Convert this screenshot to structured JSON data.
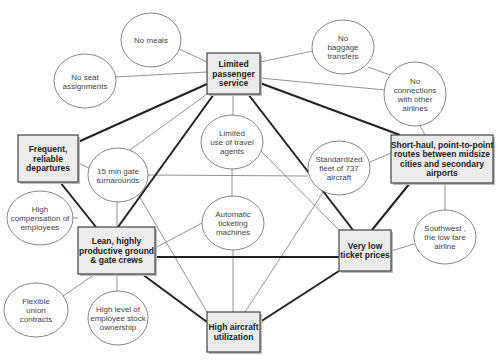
{
  "diagram": {
    "type": "activity-system-map",
    "boxes": [
      {
        "id": "limited_service",
        "lines": [
          "Limited",
          "passenger",
          "service"
        ],
        "x": 207,
        "y": 53,
        "w": 53,
        "h": 41
      },
      {
        "id": "frequent",
        "lines": [
          "Frequent,",
          "reliable",
          "departures"
        ],
        "x": 18,
        "y": 135,
        "w": 60,
        "h": 47
      },
      {
        "id": "short_haul",
        "lines": [
          "Short-haul, point-to-point",
          "routes between midsize",
          "cities and secondary",
          "airports"
        ],
        "x": 391,
        "y": 135,
        "w": 102,
        "h": 48
      },
      {
        "id": "lean_crews",
        "lines": [
          "Lean, highly",
          "productive ground",
          "& gate crews"
        ],
        "x": 78,
        "y": 227,
        "w": 77,
        "h": 47
      },
      {
        "id": "low_prices",
        "lines": [
          "Very low",
          "ticket prices"
        ],
        "x": 339,
        "y": 230,
        "w": 52,
        "h": 41
      },
      {
        "id": "high_util",
        "lines": [
          "High aircraft",
          "utilization"
        ],
        "x": 207,
        "y": 312,
        "w": 53,
        "h": 40
      }
    ],
    "ellipses": [
      {
        "id": "no_meals",
        "lines": [
          "No meals"
        ],
        "cx": 151,
        "cy": 40,
        "rx": 30,
        "ry": 27
      },
      {
        "id": "no_seat",
        "lines": [
          "No seat",
          "assignments"
        ],
        "cx": 85,
        "cy": 81,
        "rx": 31,
        "ry": 27
      },
      {
        "id": "no_baggage",
        "lines": [
          "No",
          "baggage",
          "transfers"
        ],
        "cx": 343,
        "cy": 47,
        "rx": 31,
        "ry": 27
      },
      {
        "id": "no_connections",
        "lines": [
          "No",
          "connections",
          "with other",
          "airlines"
        ],
        "cx": 415,
        "cy": 94,
        "rx": 31,
        "ry": 32
      },
      {
        "id": "travel_agents",
        "lines": [
          "Limited",
          "use of travel",
          "agents"
        ],
        "cx": 232,
        "cy": 142,
        "rx": 31,
        "ry": 27
      },
      {
        "id": "gate_turn",
        "lines": [
          "15 min gate",
          "turnarounds"
        ],
        "cx": 118,
        "cy": 175,
        "rx": 30,
        "ry": 27
      },
      {
        "id": "fleet",
        "lines": [
          "Standardized",
          "fleet of 737",
          "aircraft"
        ],
        "cx": 339,
        "cy": 168,
        "rx": 31,
        "ry": 27
      },
      {
        "id": "auto_ticket",
        "lines": [
          "Automatic",
          "ticketing",
          "machines"
        ],
        "cx": 233,
        "cy": 223,
        "rx": 31,
        "ry": 27
      },
      {
        "id": "high_comp",
        "lines": [
          "High",
          "compensation of",
          "employees"
        ],
        "cx": 40,
        "cy": 218,
        "rx": 33,
        "ry": 27
      },
      {
        "id": "union",
        "lines": [
          "Flexible",
          "union",
          "contracts"
        ],
        "cx": 36,
        "cy": 310,
        "rx": 32,
        "ry": 27
      },
      {
        "id": "stock",
        "lines": [
          "High level of",
          "employee stock",
          "ownership"
        ],
        "cx": 118,
        "cy": 318,
        "rx": 30,
        "ry": 27
      },
      {
        "id": "southwest",
        "lines": [
          "Southwest ,",
          "the low fare",
          "airline"
        ],
        "cx": 445,
        "cy": 237,
        "rx": 31,
        "ry": 27
      }
    ],
    "thick_edges": [
      [
        78,
        142,
        207,
        84
      ],
      [
        260,
        83,
        400,
        135
      ],
      [
        214,
        94,
        118,
        227
      ],
      [
        248,
        94,
        353,
        230
      ],
      [
        60,
        182,
        96,
        227
      ],
      [
        155,
        257,
        339,
        257
      ],
      [
        142,
        274,
        207,
        322
      ],
      [
        260,
        322,
        339,
        271
      ],
      [
        410,
        183,
        372,
        230
      ]
    ],
    "thin_edges": [
      [
        179,
        49,
        207,
        62
      ],
      [
        115,
        77,
        207,
        72
      ],
      [
        260,
        62,
        313,
        51
      ],
      [
        260,
        78,
        385,
        90
      ],
      [
        368,
        67,
        390,
        75
      ],
      [
        233,
        94,
        233,
        115
      ],
      [
        130,
        150,
        207,
        94
      ],
      [
        78,
        163,
        89,
        168
      ],
      [
        148,
        175,
        308,
        176
      ],
      [
        117,
        202,
        117,
        227
      ],
      [
        138,
        194,
        207,
        312
      ],
      [
        260,
        150,
        339,
        230
      ],
      [
        232,
        169,
        232,
        196
      ],
      [
        155,
        248,
        202,
        223
      ],
      [
        233,
        250,
        233,
        312
      ],
      [
        324,
        191,
        245,
        312
      ],
      [
        370,
        162,
        391,
        153
      ],
      [
        420,
        126,
        425,
        135
      ],
      [
        445,
        183,
        445,
        210
      ],
      [
        391,
        251,
        414,
        244
      ],
      [
        73,
        218,
        78,
        218
      ],
      [
        63,
        296,
        95,
        274
      ],
      [
        117,
        291,
        117,
        274
      ]
    ]
  }
}
